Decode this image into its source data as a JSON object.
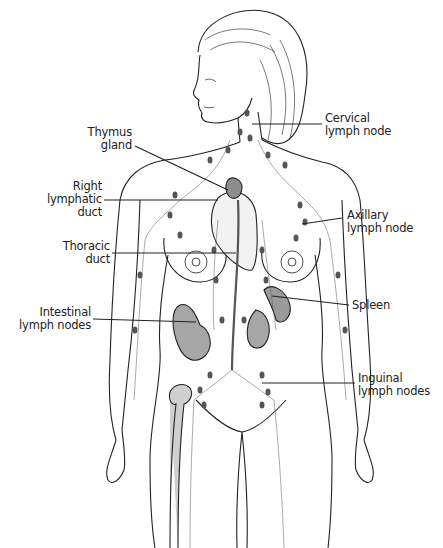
{
  "diagram": {
    "colors": {
      "line": "#222222",
      "node": "#555555",
      "organ_fill": "#9a9a9a",
      "background": "#ffffff"
    },
    "labels": [
      {
        "id": "thymus",
        "line1": "Thymus",
        "line2": "gland",
        "line3": ""
      },
      {
        "id": "right_lymphatic",
        "line1": "Right",
        "line2": "lymphatic",
        "line3": "duct"
      },
      {
        "id": "thoracic",
        "line1": "Thoracic",
        "line2": "duct",
        "line3": ""
      },
      {
        "id": "intestinal",
        "line1": "Intestinal",
        "line2": "lymph nodes",
        "line3": ""
      },
      {
        "id": "cervical",
        "line1": "Cervical",
        "line2": "lymph node",
        "line3": ""
      },
      {
        "id": "axillary",
        "line1": "Axillary",
        "line2": "lymph node",
        "line3": ""
      },
      {
        "id": "spleen",
        "line1": "Spleen",
        "line2": "",
        "line3": ""
      },
      {
        "id": "inguinal",
        "line1": "Inguinal",
        "line2": "lymph nodes",
        "line3": ""
      }
    ]
  }
}
